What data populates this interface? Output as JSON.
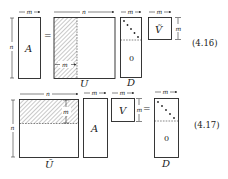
{
  "equations": [
    {
      "number": "(4.16)",
      "lhs": {
        "matrix": "A",
        "width_label": "m",
        "height_label": "n"
      },
      "equals": "=",
      "rhs": [
        {
          "matrix": "U",
          "width_label": "n",
          "inner_label": "m",
          "hatched": "left-columns"
        },
        {
          "matrix": "D",
          "width_label": "m",
          "zero_label": "0",
          "diagonal": true
        },
        {
          "matrix": "Ṽ",
          "width_label": "m",
          "height_label": "m"
        }
      ]
    },
    {
      "number": "(4.17)",
      "lhs": [
        {
          "matrix": "Ũ",
          "width_label": "n",
          "height_label": "n",
          "inner_label": "m",
          "hatched": "top-rows"
        },
        {
          "matrix": "A",
          "width_label": "m"
        },
        {
          "matrix": "V",
          "width_label": "m",
          "height_label": "m"
        }
      ],
      "equals": "=",
      "rhs": {
        "matrix": "D",
        "width_label": "m",
        "zero_label": "0",
        "diagonal": true
      }
    }
  ],
  "labels": {
    "m": "m",
    "n": "n",
    "A": "A",
    "U": "U",
    "D": "D",
    "V_tilde": "Ṽ",
    "V": "V",
    "U_tilde": "Ũ",
    "zero": "0",
    "eq": "=",
    "eq1_num": "(4.16)",
    "eq2_num": "(4.17)"
  }
}
